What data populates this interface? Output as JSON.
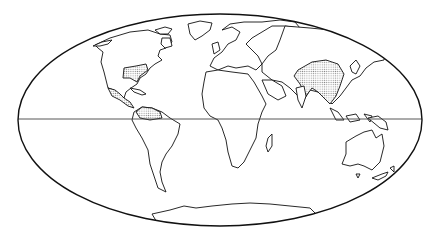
{
  "map": {
    "projection": "mollweide-style elliptical world map",
    "frame": {
      "cx": 220,
      "cy": 120,
      "rx": 202,
      "ry": 106
    },
    "equator_y": 119,
    "colors": {
      "outline": "#111111",
      "shade": "#c8c8c8",
      "background": "#ffffff"
    },
    "highlighted_regions": [
      {
        "name": "southeastern-united-states"
      },
      {
        "name": "mexico"
      },
      {
        "name": "northern-south-america"
      },
      {
        "name": "south-and-east-asia"
      }
    ],
    "landmasses": [
      "north-america",
      "greenland",
      "south-america",
      "europe",
      "africa",
      "madagascar",
      "asia",
      "arabia",
      "india",
      "southeast-asia",
      "japan",
      "indonesia",
      "new-guinea",
      "australia",
      "tasmania",
      "new-zealand",
      "antarctica"
    ]
  }
}
